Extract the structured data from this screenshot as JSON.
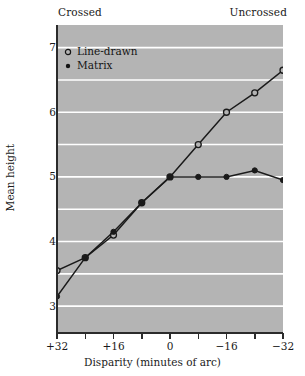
{
  "chart_data": {
    "type": "line",
    "title": "",
    "xlabel": "Disparity (minutes of arc)",
    "ylabel": "Mean height",
    "xlim": [
      32,
      -32
    ],
    "ylim": [
      2.6,
      7.35
    ],
    "x": [
      32,
      24,
      16,
      8,
      0,
      -8,
      -16,
      -24,
      -32
    ],
    "xtick_labels": [
      "+32",
      "+16",
      "0",
      "-16",
      "-32"
    ],
    "xtick_values": [
      32,
      16,
      0,
      -16,
      -32
    ],
    "xminor_ticks": [
      24,
      8,
      -8,
      -24
    ],
    "ytick_labels": [
      "3",
      "4",
      "5",
      "6",
      "7"
    ],
    "ytick_values": [
      3,
      4,
      5,
      6,
      7
    ],
    "gridlines": [
      3.0,
      3.5,
      4.0,
      4.5,
      5.0,
      5.5,
      6.0,
      6.5,
      7.0
    ],
    "grid": true,
    "grid_color": "#ffffff",
    "plot_background": "#b4b4b4",
    "line_color": "#1a1a1a",
    "legend_position": "top-left",
    "series": [
      {
        "name": "Line-drawn",
        "marker": "open-circle",
        "values": [
          3.55,
          3.75,
          4.1,
          4.6,
          5.0,
          5.5,
          6.0,
          6.3,
          6.65
        ]
      },
      {
        "name": "Matrix",
        "marker": "filled-circle",
        "values": [
          3.15,
          3.75,
          4.15,
          4.6,
          5.0,
          5.0,
          5.0,
          5.1,
          4.95
        ]
      }
    ],
    "annotations": {
      "top_left": "Crossed",
      "top_right": "Uncrossed"
    }
  },
  "legend": {
    "items": [
      {
        "label": "Line-drawn",
        "marker": "open-circle"
      },
      {
        "label": "Matrix",
        "marker": "filled-circle"
      }
    ]
  }
}
